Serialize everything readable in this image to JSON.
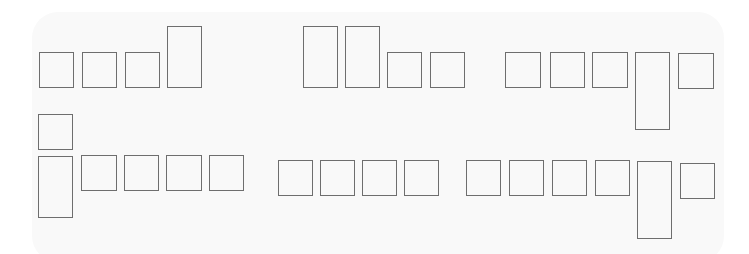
{
  "diagram": {
    "type": "block-arrangement",
    "background_color": "#ffffff",
    "panel_color": "#f9f9f9",
    "stroke_color": "#6e6e6e",
    "boxes": [
      {
        "id": "r1-g1-1",
        "x": 39,
        "y": 52,
        "w": 35,
        "h": 36,
        "shape": "square"
      },
      {
        "id": "r1-g1-2",
        "x": 82,
        "y": 52,
        "w": 35,
        "h": 36,
        "shape": "square"
      },
      {
        "id": "r1-g1-3",
        "x": 125,
        "y": 52,
        "w": 35,
        "h": 36,
        "shape": "square"
      },
      {
        "id": "r1-g1-4",
        "x": 167,
        "y": 26,
        "w": 35,
        "h": 62,
        "shape": "tall"
      },
      {
        "id": "r1-g2-1",
        "x": 303,
        "y": 26,
        "w": 35,
        "h": 62,
        "shape": "tall"
      },
      {
        "id": "r1-g2-2",
        "x": 345,
        "y": 26,
        "w": 35,
        "h": 62,
        "shape": "tall"
      },
      {
        "id": "r1-g2-3",
        "x": 387,
        "y": 52,
        "w": 35,
        "h": 36,
        "shape": "square"
      },
      {
        "id": "r1-g2-4",
        "x": 430,
        "y": 52,
        "w": 35,
        "h": 36,
        "shape": "square"
      },
      {
        "id": "r1-g3-1",
        "x": 505,
        "y": 52,
        "w": 36,
        "h": 36,
        "shape": "square"
      },
      {
        "id": "r1-g3-2",
        "x": 550,
        "y": 52,
        "w": 35,
        "h": 36,
        "shape": "square"
      },
      {
        "id": "r1-g3-3",
        "x": 592,
        "y": 52,
        "w": 36,
        "h": 36,
        "shape": "square"
      },
      {
        "id": "r1-g3-4",
        "x": 635,
        "y": 52,
        "w": 35,
        "h": 78,
        "shape": "tall"
      },
      {
        "id": "r1-g3-5",
        "x": 678,
        "y": 53,
        "w": 36,
        "h": 36,
        "shape": "square"
      },
      {
        "id": "r2-g1-0",
        "x": 38,
        "y": 114,
        "w": 35,
        "h": 36,
        "shape": "square"
      },
      {
        "id": "r2-g1-1",
        "x": 38,
        "y": 156,
        "w": 35,
        "h": 62,
        "shape": "tall"
      },
      {
        "id": "r2-g1-2",
        "x": 81,
        "y": 155,
        "w": 36,
        "h": 36,
        "shape": "square"
      },
      {
        "id": "r2-g1-3",
        "x": 124,
        "y": 155,
        "w": 35,
        "h": 36,
        "shape": "square"
      },
      {
        "id": "r2-g1-4",
        "x": 166,
        "y": 155,
        "w": 36,
        "h": 36,
        "shape": "square"
      },
      {
        "id": "r2-g1-5",
        "x": 209,
        "y": 155,
        "w": 35,
        "h": 36,
        "shape": "square"
      },
      {
        "id": "r2-g2-1",
        "x": 278,
        "y": 160,
        "w": 35,
        "h": 36,
        "shape": "square"
      },
      {
        "id": "r2-g2-2",
        "x": 320,
        "y": 160,
        "w": 35,
        "h": 36,
        "shape": "square"
      },
      {
        "id": "r2-g2-3",
        "x": 362,
        "y": 160,
        "w": 35,
        "h": 36,
        "shape": "square"
      },
      {
        "id": "r2-g2-4",
        "x": 404,
        "y": 160,
        "w": 35,
        "h": 36,
        "shape": "square"
      },
      {
        "id": "r2-g3-1",
        "x": 466,
        "y": 160,
        "w": 35,
        "h": 36,
        "shape": "square"
      },
      {
        "id": "r2-g3-2",
        "x": 509,
        "y": 160,
        "w": 35,
        "h": 36,
        "shape": "square"
      },
      {
        "id": "r2-g3-3",
        "x": 552,
        "y": 160,
        "w": 35,
        "h": 36,
        "shape": "square"
      },
      {
        "id": "r2-g3-4",
        "x": 595,
        "y": 160,
        "w": 35,
        "h": 36,
        "shape": "square"
      },
      {
        "id": "r2-g3-5",
        "x": 637,
        "y": 161,
        "w": 35,
        "h": 78,
        "shape": "tall"
      },
      {
        "id": "r2-g3-6",
        "x": 680,
        "y": 163,
        "w": 35,
        "h": 36,
        "shape": "square"
      }
    ]
  }
}
